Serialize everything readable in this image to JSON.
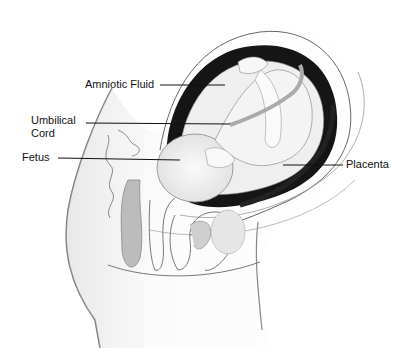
{
  "diagram": {
    "type": "anatomical-cross-section",
    "labels": [
      {
        "id": "amniotic-fluid",
        "text": "Amniotic Fluid",
        "x": 85,
        "y": 78,
        "line": [
          160,
          85,
          225,
          85
        ]
      },
      {
        "id": "umbilical-cord",
        "lines": [
          "Umbilical",
          "Cord"
        ],
        "x": 31,
        "y": 114,
        "line": [
          86,
          123,
          230,
          124
        ]
      },
      {
        "id": "fetus",
        "text": "Fetus",
        "x": 22,
        "y": 151,
        "line": [
          58,
          158,
          180,
          160
        ]
      },
      {
        "id": "placenta",
        "text": "Placenta",
        "x": 346,
        "y": 162,
        "line": [
          283,
          165,
          343,
          165
        ]
      }
    ]
  }
}
